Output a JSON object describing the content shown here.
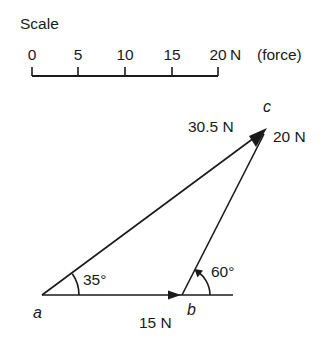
{
  "scale": {
    "title": "Scale",
    "ticks": [
      "0",
      "5",
      "10",
      "15",
      "20"
    ],
    "unit_label": "N",
    "quantity_label": "(force)"
  },
  "vectors": {
    "ab": {
      "label": "15 N",
      "magnitude": 15
    },
    "bc": {
      "label": "20 N",
      "magnitude": 20
    },
    "ac": {
      "label": "30.5 N",
      "magnitude": 30.5
    }
  },
  "angles": {
    "at_a": "35°",
    "at_b": "60°"
  },
  "points": {
    "a": "a",
    "b": "b",
    "c": "c"
  },
  "colors": {
    "ink": "#1a1a1a",
    "background": "#ffffff"
  }
}
